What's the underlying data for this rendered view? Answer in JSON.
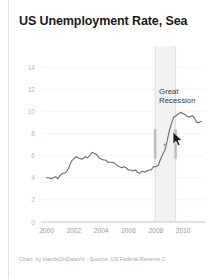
{
  "chart_data": {
    "type": "line",
    "title": "US Unemployment Rate, Sea",
    "caption": "Chart: by HandsOnDataViz · Source: US Federal Reserve C",
    "xlabel": "",
    "ylabel": "",
    "xlim": [
      1999.6,
      2011.6
    ],
    "ylim": [
      0,
      15
    ],
    "grid": true,
    "legend": null,
    "x_ticks": [
      "2000",
      "2002",
      "2004",
      "2006",
      "2008",
      "2010"
    ],
    "x_tick_values": [
      2000,
      2002,
      2004,
      2006,
      2008,
      2010
    ],
    "y_ticks": [
      "0",
      "2",
      "4",
      "6",
      "8",
      "10",
      "12",
      "14"
    ],
    "y_tick_values": [
      0,
      2,
      4,
      6,
      8,
      10,
      12,
      14
    ],
    "line_color": "#6b6b6b",
    "annotations": [
      {
        "label": "Great\nRecession",
        "line1": "Great",
        "line2": "Recession",
        "type": "shaded-band",
        "band_start": 2007.95,
        "band_end": 2009.45,
        "band_color": "#f2f2f2"
      }
    ],
    "series": [
      {
        "name": "US Unemployment Rate",
        "x": [
          2000.0,
          2000.17,
          2000.33,
          2000.5,
          2000.67,
          2000.83,
          2001.0,
          2001.17,
          2001.33,
          2001.5,
          2001.67,
          2001.83,
          2002.0,
          2002.17,
          2002.33,
          2002.5,
          2002.67,
          2002.83,
          2003.0,
          2003.17,
          2003.33,
          2003.5,
          2003.67,
          2003.83,
          2004.0,
          2004.17,
          2004.33,
          2004.5,
          2004.67,
          2004.83,
          2005.0,
          2005.17,
          2005.33,
          2005.5,
          2005.67,
          2005.83,
          2006.0,
          2006.17,
          2006.33,
          2006.5,
          2006.67,
          2006.83,
          2007.0,
          2007.17,
          2007.33,
          2007.5,
          2007.67,
          2007.83,
          2008.0,
          2008.17,
          2008.33,
          2008.5,
          2008.67,
          2008.83,
          2009.0,
          2009.17,
          2009.33,
          2009.5,
          2009.67,
          2009.83,
          2010.0,
          2010.17,
          2010.33,
          2010.5,
          2010.67,
          2010.83,
          2011.0,
          2011.17,
          2011.33
        ],
        "y": [
          4.0,
          4.0,
          3.9,
          4.0,
          4.1,
          3.9,
          4.2,
          4.4,
          4.4,
          4.6,
          5.0,
          5.5,
          5.7,
          5.9,
          5.8,
          5.7,
          5.7,
          5.9,
          5.8,
          6.0,
          6.3,
          6.2,
          6.1,
          5.8,
          5.7,
          5.6,
          5.6,
          5.4,
          5.4,
          5.4,
          5.3,
          5.1,
          5.0,
          4.9,
          5.0,
          4.9,
          4.7,
          4.7,
          4.6,
          4.7,
          4.5,
          4.4,
          4.6,
          4.5,
          4.6,
          4.7,
          4.7,
          5.0,
          5.0,
          5.1,
          5.6,
          6.1,
          6.5,
          7.3,
          8.3,
          9.0,
          9.5,
          9.6,
          9.8,
          9.9,
          9.8,
          9.7,
          9.5,
          9.5,
          9.6,
          9.4,
          9.0,
          9.0,
          9.1
        ]
      }
    ]
  },
  "cursor": {
    "name": "mouse-pointer",
    "x": 163,
    "y": 131
  }
}
